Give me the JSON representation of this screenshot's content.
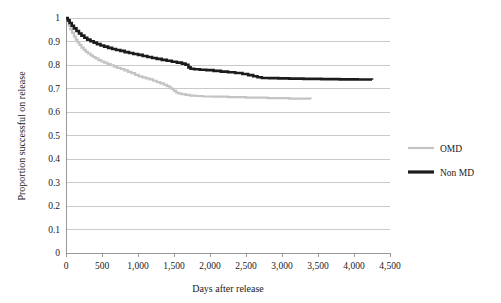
{
  "chart_data": {
    "type": "line",
    "title": "",
    "xlabel": "Days after release",
    "ylabel": "Proportion successful on release",
    "xlim": [
      0,
      4500
    ],
    "ylim": [
      0,
      1
    ],
    "grid": "horizontal",
    "legend_position": "right",
    "x_ticks": [
      "0",
      "500",
      "1,000",
      "1,500",
      "2,000",
      "2,500",
      "3,000",
      "3,500",
      "4,000",
      "4,500"
    ],
    "x_tick_values": [
      0,
      500,
      1000,
      1500,
      2000,
      2500,
      3000,
      3500,
      4000,
      4500
    ],
    "y_ticks": [
      "0",
      "0.1",
      "0.2",
      "0.3",
      "0.4",
      "0.5",
      "0.6",
      "0.7",
      "0.8",
      "0.9",
      "1"
    ],
    "y_tick_values": [
      0,
      0.1,
      0.2,
      0.3,
      0.4,
      0.5,
      0.6,
      0.7,
      0.8,
      0.9,
      1
    ],
    "series": [
      {
        "name": "OMD",
        "color": "#c4c4c4",
        "stroke_width": 2.2,
        "style": "step",
        "points": [
          [
            0,
            1.0
          ],
          [
            20,
            0.985
          ],
          [
            40,
            0.968
          ],
          [
            60,
            0.952
          ],
          [
            85,
            0.937
          ],
          [
            110,
            0.922
          ],
          [
            135,
            0.908
          ],
          [
            160,
            0.896
          ],
          [
            185,
            0.886
          ],
          [
            215,
            0.874
          ],
          [
            245,
            0.864
          ],
          [
            275,
            0.856
          ],
          [
            305,
            0.849
          ],
          [
            340,
            0.841
          ],
          [
            375,
            0.834
          ],
          [
            410,
            0.828
          ],
          [
            450,
            0.821
          ],
          [
            490,
            0.815
          ],
          [
            530,
            0.81
          ],
          [
            575,
            0.804
          ],
          [
            620,
            0.799
          ],
          [
            665,
            0.793
          ],
          [
            710,
            0.788
          ],
          [
            760,
            0.783
          ],
          [
            810,
            0.777
          ],
          [
            860,
            0.771
          ],
          [
            910,
            0.765
          ],
          [
            960,
            0.758
          ],
          [
            1010,
            0.752
          ],
          [
            1060,
            0.747
          ],
          [
            1110,
            0.743
          ],
          [
            1160,
            0.739
          ],
          [
            1210,
            0.733
          ],
          [
            1260,
            0.727
          ],
          [
            1310,
            0.722
          ],
          [
            1360,
            0.716
          ],
          [
            1400,
            0.71
          ],
          [
            1440,
            0.703
          ],
          [
            1470,
            0.697
          ],
          [
            1500,
            0.69
          ],
          [
            1530,
            0.683
          ],
          [
            1560,
            0.679
          ],
          [
            1600,
            0.676
          ],
          [
            1660,
            0.673
          ],
          [
            1720,
            0.67
          ],
          [
            1800,
            0.668
          ],
          [
            1900,
            0.666
          ],
          [
            2050,
            0.665
          ],
          [
            2250,
            0.663
          ],
          [
            2500,
            0.661
          ],
          [
            2800,
            0.659
          ],
          [
            3100,
            0.657
          ],
          [
            3400,
            0.656
          ]
        ]
      },
      {
        "name": "Non MD",
        "color": "#1c1c1c",
        "stroke_width": 2.6,
        "style": "step",
        "points": [
          [
            0,
            1.0
          ],
          [
            25,
            0.99
          ],
          [
            50,
            0.979
          ],
          [
            80,
            0.967
          ],
          [
            110,
            0.956
          ],
          [
            145,
            0.945
          ],
          [
            180,
            0.934
          ],
          [
            215,
            0.925
          ],
          [
            255,
            0.916
          ],
          [
            295,
            0.908
          ],
          [
            340,
            0.901
          ],
          [
            385,
            0.895
          ],
          [
            430,
            0.889
          ],
          [
            480,
            0.883
          ],
          [
            530,
            0.878
          ],
          [
            585,
            0.873
          ],
          [
            640,
            0.868
          ],
          [
            695,
            0.864
          ],
          [
            755,
            0.86
          ],
          [
            815,
            0.855
          ],
          [
            875,
            0.851
          ],
          [
            935,
            0.847
          ],
          [
            1000,
            0.843
          ],
          [
            1065,
            0.838
          ],
          [
            1130,
            0.834
          ],
          [
            1195,
            0.83
          ],
          [
            1260,
            0.826
          ],
          [
            1330,
            0.822
          ],
          [
            1400,
            0.818
          ],
          [
            1470,
            0.814
          ],
          [
            1540,
            0.81
          ],
          [
            1610,
            0.806
          ],
          [
            1660,
            0.801
          ],
          [
            1700,
            0.79
          ],
          [
            1730,
            0.784
          ],
          [
            1780,
            0.782
          ],
          [
            1860,
            0.78
          ],
          [
            1950,
            0.778
          ],
          [
            2050,
            0.775
          ],
          [
            2150,
            0.772
          ],
          [
            2250,
            0.769
          ],
          [
            2350,
            0.766
          ],
          [
            2450,
            0.762
          ],
          [
            2530,
            0.757
          ],
          [
            2600,
            0.752
          ],
          [
            2660,
            0.748
          ],
          [
            2720,
            0.745
          ],
          [
            2820,
            0.744
          ],
          [
            2950,
            0.743
          ],
          [
            3100,
            0.742
          ],
          [
            3300,
            0.741
          ],
          [
            3550,
            0.74
          ],
          [
            3800,
            0.739
          ],
          [
            4050,
            0.738
          ],
          [
            4250,
            0.737
          ]
        ]
      }
    ]
  },
  "legend": {
    "items": [
      {
        "label": "OMD",
        "color": "#c4c4c4"
      },
      {
        "label": "Non MD",
        "color": "#1c1c1c"
      }
    ]
  },
  "axes": {
    "x_title": "Days after release",
    "y_title": "Proportion successful on release"
  }
}
